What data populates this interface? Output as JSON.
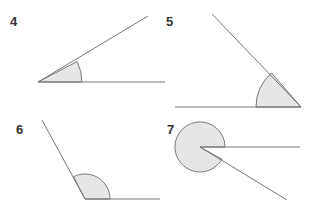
{
  "figures": [
    {
      "label": "4",
      "vertex": [
        38,
        82
      ],
      "ray_a": [
        165,
        82
      ],
      "ray_b": [
        148,
        16
      ],
      "arc_radius": 44,
      "angle_type": "acute"
    },
    {
      "label": "5",
      "vertex": [
        301,
        107
      ],
      "ray_a": [
        175,
        107
      ],
      "ray_b": [
        212,
        14
      ],
      "arc_radius": 45,
      "angle_type": "acute"
    },
    {
      "label": "6",
      "vertex": [
        85,
        199
      ],
      "ray_a": [
        160,
        199
      ],
      "ray_b": [
        42,
        120
      ],
      "arc_radius": 25,
      "angle_type": "obtuse"
    },
    {
      "label": "7",
      "vertex": [
        200,
        147
      ],
      "ray_a": [
        300,
        147
      ],
      "ray_b": [
        287,
        200
      ],
      "arc_radius": 25,
      "angle_type": "reflex"
    }
  ],
  "colors": {
    "line": "#777777",
    "fill": "#e6e6e6",
    "label": "#333333"
  }
}
